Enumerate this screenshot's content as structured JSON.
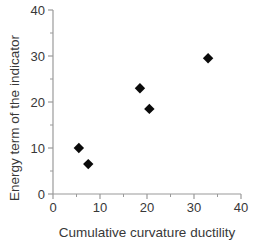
{
  "chart_data": {
    "type": "scatter",
    "title": "",
    "xlabel": "Cumulative curvature ductility",
    "ylabel": "Energy term of the indicator",
    "xlim": [
      0,
      40
    ],
    "ylim": [
      0,
      40
    ],
    "x_major_ticks": [
      0,
      10,
      20,
      30,
      40
    ],
    "x_minor_ticks": [
      5,
      15,
      25,
      35
    ],
    "y_major_ticks": [
      0,
      10,
      20,
      30,
      40
    ],
    "y_minor_ticks": [
      5,
      15,
      25,
      35
    ],
    "points": [
      [
        5.5,
        10
      ],
      [
        7.5,
        6.5
      ],
      [
        18.5,
        23
      ],
      [
        20.5,
        18.5
      ],
      [
        33,
        29.5
      ]
    ],
    "marker": "filled-diamond",
    "grid": false,
    "legend": "none",
    "colors": {
      "background": "#ffffff",
      "axis": "#9a9a9a",
      "tick": "#9a9a9a",
      "text": "#383838",
      "marker": "#0a0a0a"
    }
  }
}
